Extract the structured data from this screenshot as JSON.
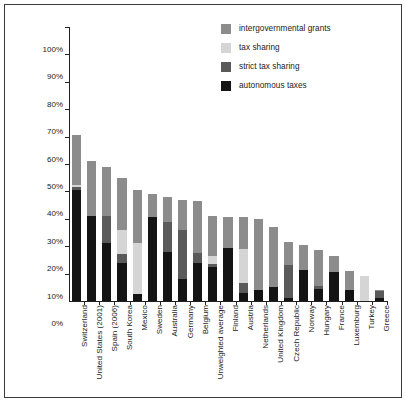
{
  "chart_data": {
    "type": "bar",
    "subtype": "stacked-bar",
    "title": "",
    "xlabel": "",
    "ylabel": "",
    "ylim": [
      0,
      100
    ],
    "ytick_labels": [
      "0%",
      "10%",
      "20%",
      "30%",
      "40%",
      "50%",
      "60%",
      "70%",
      "80%",
      "90%",
      "100%"
    ],
    "ytick_values": [
      0,
      10,
      20,
      30,
      40,
      50,
      60,
      70,
      80,
      90,
      100
    ],
    "grid": false,
    "legend_position": "top-right",
    "legend": [
      {
        "label": "intergovernmental grants",
        "color": "#8c8c8c"
      },
      {
        "label": "tax sharing",
        "color": "#d5d5d5"
      },
      {
        "label": "strict tax sharing",
        "color": "#5a5a5a"
      },
      {
        "label": "autonomous taxes",
        "color": "#141414"
      }
    ],
    "categories": [
      "Switzerland",
      "United States (2001)",
      "Spain (2006)",
      "South Korea",
      "Mexico",
      "Sweden",
      "Australia",
      "Germany",
      "Belgium",
      "Unweighted average",
      "Finland",
      "Austria",
      "Netherlands",
      "United Kingdom",
      "Czech Republic",
      "Norway",
      "Hungary",
      "France",
      "Luxemburg",
      "Turkey",
      "Greece"
    ],
    "series": [
      {
        "name": "autonomous taxes",
        "color": "#141414",
        "values": [
          40.5,
          31.0,
          21.0,
          14.0,
          2.5,
          30.5,
          18.0,
          8.0,
          14.0,
          12.5,
          19.5,
          3.0,
          4.0,
          5.0,
          1.0,
          11.5,
          4.5,
          10.5,
          4.0,
          0.0,
          1.0
        ]
      },
      {
        "name": "strict tax sharing",
        "color": "#5a5a5a",
        "values": [
          1.0,
          0.0,
          10.0,
          3.0,
          0.0,
          0.0,
          11.0,
          18.0,
          3.5,
          1.0,
          0.0,
          3.5,
          0.0,
          0.0,
          12.0,
          0.0,
          1.0,
          0.0,
          0.0,
          0.0,
          2.5
        ]
      },
      {
        "name": "tax sharing",
        "color": "#d5d5d5",
        "values": [
          1.0,
          0.0,
          0.0,
          9.0,
          18.5,
          0.0,
          0.0,
          0.0,
          0.0,
          3.0,
          0.0,
          12.5,
          0.0,
          0.0,
          0.0,
          0.0,
          0.0,
          0.0,
          0.0,
          9.0,
          0.0
        ]
      },
      {
        "name": "intergovernmental grants",
        "color": "#8c8c8c",
        "values": [
          18.0,
          20.0,
          18.0,
          19.0,
          19.5,
          8.5,
          9.0,
          11.0,
          19.0,
          14.5,
          11.0,
          11.5,
          26.0,
          22.0,
          8.5,
          9.0,
          13.0,
          6.0,
          7.0,
          0.0,
          0.5
        ]
      }
    ],
    "totals": [
      60.5,
      51.0,
      49.0,
      45.0,
      40.5,
      39.0,
      38.0,
      37.0,
      36.5,
      31.0,
      30.5,
      30.5,
      30.0,
      27.0,
      21.5,
      20.5,
      18.5,
      16.5,
      11.0,
      9.0,
      4.0
    ]
  }
}
